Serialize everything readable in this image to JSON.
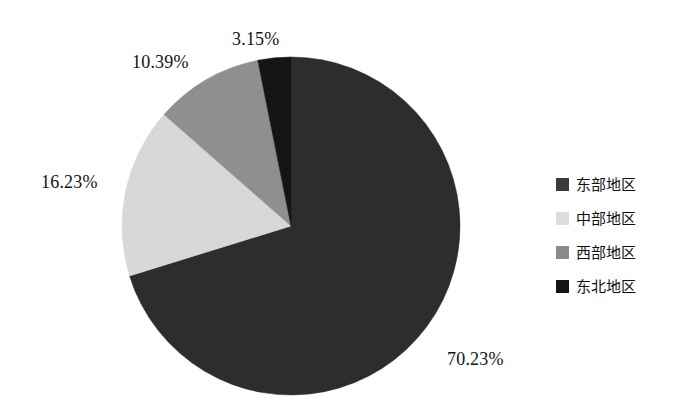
{
  "chart_data": {
    "type": "pie",
    "title": "",
    "labels": [
      "东部地区",
      "中部地区",
      "西部地区",
      "东北地区"
    ],
    "values": [
      70.23,
      16.23,
      10.39,
      3.15
    ],
    "value_labels": [
      "70.23%",
      "16.23%",
      "10.39%",
      "3.15%"
    ],
    "colors": [
      "#2d2d2d",
      "#d8d8d8",
      "#8f8f8f",
      "#141414"
    ],
    "units": "percent",
    "start_angle_deg": 0,
    "direction": "clockwise",
    "legend_position": "right",
    "grid": false,
    "xlabel": "",
    "ylabel": ""
  },
  "labels": {
    "east": "70.23%",
    "central": "16.23%",
    "west": "10.39%",
    "northeast": "3.15%"
  },
  "legend": {
    "items": [
      {
        "label": "东部地区",
        "color": "#3a3a3a"
      },
      {
        "label": "中部地区",
        "color": "#dcdcdc"
      },
      {
        "label": "西部地区",
        "color": "#8a8a8a"
      },
      {
        "label": "东北地区",
        "color": "#141414"
      }
    ]
  },
  "geometry": {
    "center_x": 291,
    "center_y": 226,
    "radius": 169
  }
}
